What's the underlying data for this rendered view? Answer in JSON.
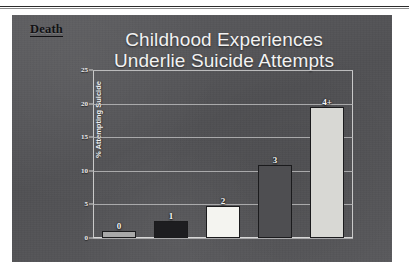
{
  "slide": {
    "section_tag": "Death",
    "title_line_1": "Childhood Experiences",
    "title_line_2": "Underlie Suicide Attempts",
    "background_color": "#555558",
    "title_color": "#f2f2f2",
    "tag_color": "#111114"
  },
  "chart_data": {
    "type": "bar",
    "title": "Childhood Experiences Underlie Suicide Attempts",
    "xlabel": "",
    "ylabel": "% Attempting Suicide",
    "categories": [
      "0",
      "1",
      "2",
      "3",
      "4+"
    ],
    "values": [
      1.1,
      2.5,
      4.8,
      10.8,
      19.5
    ],
    "bar_labels": [
      "0",
      "1",
      "2",
      "3",
      "4+"
    ],
    "bar_colors": [
      "#a8a8a8",
      "#1d1d20",
      "#f4f4f0",
      "#4e4e51",
      "#d8d8d4"
    ],
    "ylim": [
      0,
      25
    ],
    "yticks": [
      0,
      5,
      10,
      15,
      20,
      25
    ],
    "ytick_labels": [
      "0",
      "5",
      "10",
      "15",
      "20",
      "25"
    ],
    "grid": true,
    "legend": "none",
    "gridline_color": "#b9b9ba",
    "axis_color": "#c9c9c9"
  }
}
